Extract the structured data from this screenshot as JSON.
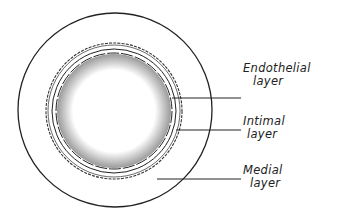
{
  "diagram": {
    "type": "cross-section of artery",
    "labels": [
      {
        "line1": "Endothelial",
        "line2": "layer"
      },
      {
        "line1": "Intimal",
        "line2": "layer"
      },
      {
        "line1": "Medial",
        "line2": "layer"
      }
    ],
    "colors": {
      "ink": "#222222",
      "background": "#ffffff"
    }
  }
}
